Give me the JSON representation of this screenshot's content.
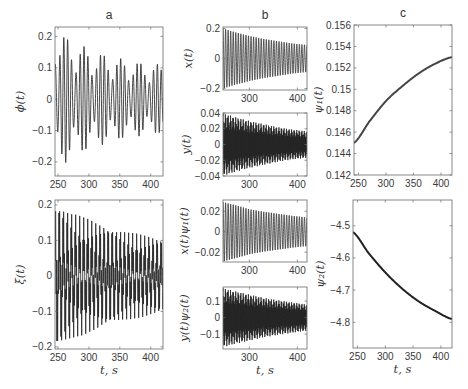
{
  "figure": {
    "panel_labels": [
      "a",
      "b",
      "c"
    ]
  },
  "chart_data": [
    {
      "id": "a1",
      "type": "line",
      "title": "a",
      "ylabel": "ϕ(t)",
      "xlabel": "",
      "xlim": [
        245,
        420
      ],
      "ylim": [
        -0.245,
        0.23
      ],
      "xticks": [
        250,
        300,
        350,
        400
      ],
      "xtick_labels": [
        "250",
        "300",
        "350",
        "400"
      ],
      "yticks": [
        -0.2,
        -0.1,
        0,
        0.1,
        0.2
      ],
      "ytick_labels": [
        "−0.2",
        "−0.1",
        "0",
        "0.1",
        "0.2"
      ],
      "grid": false,
      "series": [
        {
          "name": "phi",
          "kind": "oscillation",
          "t": [
            245,
            270,
            300,
            330,
            360,
            390,
            420
          ],
          "envelope": [
            0.23,
            0.19,
            0.16,
            0.14,
            0.125,
            0.115,
            0.11
          ],
          "components": [
            {
              "amp": 0.72,
              "period_s": 6.6,
              "phase": 0.0
            },
            {
              "amp": 0.28,
              "period_s": 5.4,
              "phase": 1.0
            }
          ],
          "dt": 0.2,
          "color": "#333333",
          "width": 0.9
        }
      ]
    },
    {
      "id": "a2",
      "type": "line",
      "title": "",
      "ylabel": "ξ(t)",
      "xlabel": "t, s",
      "xlim": [
        245,
        420
      ],
      "ylim": [
        -0.206,
        0.214
      ],
      "xticks": [
        250,
        300,
        350,
        400
      ],
      "xtick_labels": [
        "250",
        "300",
        "350",
        "400"
      ],
      "yticks": [
        -0.2,
        -0.1,
        0,
        0.1,
        0.2
      ],
      "ytick_labels": [
        "−0.2",
        "−0.1",
        "0",
        "0.1",
        "0.2"
      ],
      "grid": false,
      "series": [
        {
          "name": "xi",
          "kind": "oscillation",
          "t": [
            245,
            270,
            300,
            330,
            360,
            390,
            420
          ],
          "envelope": [
            0.21,
            0.18,
            0.16,
            0.14,
            0.125,
            0.115,
            0.105
          ],
          "components": [
            {
              "amp": 0.6,
              "period_s": 6.6,
              "phase": 0.5
            },
            {
              "amp": 0.4,
              "period_s": 1.3,
              "phase": 0.0
            }
          ],
          "dt": 0.08,
          "color": "#222222",
          "width": 0.8
        }
      ]
    },
    {
      "id": "b1",
      "type": "line",
      "title": "b",
      "ylabel": "x(t)",
      "xlabel": "",
      "xlim": [
        245,
        420
      ],
      "ylim": [
        -0.21,
        0.21
      ],
      "xticks": [
        300,
        400
      ],
      "xtick_labels": [
        "300",
        "400"
      ],
      "yticks": [
        -0.2,
        0,
        0.2
      ],
      "ytick_labels": [
        "−0.2",
        "0",
        "0.2"
      ],
      "grid": false,
      "series": [
        {
          "name": "x",
          "kind": "oscillation",
          "t": [
            245,
            270,
            300,
            330,
            360,
            390,
            420
          ],
          "envelope": [
            0.2,
            0.175,
            0.15,
            0.13,
            0.115,
            0.1,
            0.09
          ],
          "components": [
            {
              "amp": 1.0,
              "period_s": 5.3,
              "phase": 0.0
            }
          ],
          "dt": 0.15,
          "color": "#333333",
          "width": 0.8
        }
      ]
    },
    {
      "id": "b2",
      "type": "line",
      "title": "",
      "ylabel": "y(t)",
      "xlabel": "",
      "xlim": [
        245,
        420
      ],
      "ylim": [
        -0.04,
        0.04
      ],
      "xticks": [
        300,
        400
      ],
      "xtick_labels": [
        "300",
        "400"
      ],
      "yticks": [
        -0.04,
        -0.02,
        0,
        0.02,
        0.04
      ],
      "ytick_labels": [
        "−0.04",
        "−0.02",
        "0",
        "0.02",
        "0.04"
      ],
      "grid": false,
      "series": [
        {
          "name": "y",
          "kind": "oscillation",
          "t": [
            245,
            270,
            300,
            330,
            360,
            390,
            420
          ],
          "envelope": [
            0.04,
            0.035,
            0.03,
            0.026,
            0.022,
            0.019,
            0.017
          ],
          "components": [
            {
              "amp": 0.75,
              "period_s": 1.2,
              "phase": 0.0
            },
            {
              "amp": 0.25,
              "period_s": 5.3,
              "phase": 0.3
            }
          ],
          "dt": 0.08,
          "color": "#222222",
          "width": 0.8
        }
      ]
    },
    {
      "id": "b3",
      "type": "line",
      "title": "",
      "ylabel": "x(t)ψ₁(t)",
      "xlabel": "",
      "xlim": [
        245,
        420
      ],
      "ylim": [
        -0.0296,
        0.031
      ],
      "xticks": [
        300,
        400
      ],
      "xtick_labels": [
        "300",
        "400"
      ],
      "yticks": [
        -0.02,
        0,
        0.02
      ],
      "ytick_labels": [
        "−0.02",
        "0",
        "0.02"
      ],
      "grid": false,
      "series": [
        {
          "name": "x_psi1",
          "kind": "oscillation",
          "t": [
            245,
            270,
            300,
            330,
            360,
            390,
            420
          ],
          "envelope": [
            0.029,
            0.026,
            0.022,
            0.0195,
            0.0175,
            0.0155,
            0.014
          ],
          "components": [
            {
              "amp": 1.0,
              "period_s": 5.3,
              "phase": 0.0
            }
          ],
          "dt": 0.15,
          "color": "#333333",
          "width": 0.8
        }
      ]
    },
    {
      "id": "b4",
      "type": "line",
      "title": "",
      "ylabel": "y(t)ψ₂(t)",
      "xlabel": "t, s",
      "xlim": [
        245,
        420
      ],
      "ylim": [
        -0.19,
        0.185
      ],
      "xticks": [
        300,
        400
      ],
      "xtick_labels": [
        "300",
        "400"
      ],
      "yticks": [
        -0.1,
        0,
        0.1
      ],
      "ytick_labels": [
        "−0.1",
        "0",
        "0.1"
      ],
      "grid": false,
      "series": [
        {
          "name": "y_psi2",
          "kind": "oscillation",
          "t": [
            245,
            270,
            300,
            330,
            360,
            390,
            420
          ],
          "envelope": [
            0.18,
            0.16,
            0.14,
            0.12,
            0.105,
            0.092,
            0.08
          ],
          "components": [
            {
              "amp": 0.75,
              "period_s": 1.2,
              "phase": 0.0
            },
            {
              "amp": 0.25,
              "period_s": 5.3,
              "phase": 0.3
            }
          ],
          "dt": 0.08,
          "color": "#222222",
          "width": 0.8
        }
      ]
    },
    {
      "id": "c1",
      "type": "line",
      "title": "c",
      "ylabel": "ψ₁(t)",
      "xlabel": "",
      "xlim": [
        242,
        420
      ],
      "ylim": [
        0.142,
        0.156
      ],
      "xticks": [
        250,
        300,
        350,
        400
      ],
      "xtick_labels": [
        "250",
        "300",
        "350",
        "400"
      ],
      "yticks": [
        0.142,
        0.144,
        0.146,
        0.148,
        0.15,
        0.152,
        0.154,
        0.156
      ],
      "ytick_labels": [
        "0.142",
        "0.144",
        "0.146",
        "0.148",
        "0.15",
        "0.152",
        "0.154",
        "0.156"
      ],
      "grid": false,
      "series": [
        {
          "name": "psi1",
          "kind": "curve",
          "t": [
            242,
            270,
            300,
            330,
            360,
            390,
            420
          ],
          "values": [
            0.145,
            0.147,
            0.1489,
            0.1503,
            0.1515,
            0.1524,
            0.153
          ],
          "color": "#444444",
          "width": 2.0
        }
      ]
    },
    {
      "id": "c2",
      "type": "line",
      "title": "",
      "ylabel": "ψ₂(t)",
      "xlabel": "t, s",
      "xlim": [
        242,
        420
      ],
      "ylim": [
        -4.88,
        -4.42
      ],
      "xticks": [
        250,
        300,
        350,
        400
      ],
      "xtick_labels": [
        "250",
        "300",
        "350",
        "400"
      ],
      "yticks": [
        -4.8,
        -4.7,
        -4.6,
        -4.5
      ],
      "ytick_labels": [
        "−4.8",
        "−4.7",
        "−4.6",
        "−4.5"
      ],
      "grid": false,
      "series": [
        {
          "name": "psi2",
          "kind": "curve",
          "t": [
            242,
            270,
            300,
            330,
            360,
            390,
            420
          ],
          "values": [
            -4.52,
            -4.585,
            -4.645,
            -4.695,
            -4.735,
            -4.765,
            -4.79
          ],
          "color": "#222222",
          "width": 2.0
        }
      ]
    }
  ]
}
